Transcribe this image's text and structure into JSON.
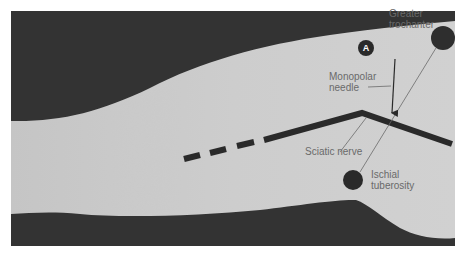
{
  "figure": {
    "colors": {
      "background_dark": "#2e2e2e",
      "skin": "#cfcfcf",
      "line": "#2a2a2a",
      "label_text": "#6a6a6a",
      "page": "#ffffff"
    },
    "markers": {
      "a": {
        "label": "A"
      },
      "greater_trochanter": {
        "label": ""
      },
      "ischial_tuberosity": {
        "label": ""
      }
    },
    "labels": {
      "greater_trochanter": [
        "Greater",
        "trochanter"
      ],
      "monopolar_needle": [
        "Monopolar",
        "needle"
      ],
      "sciatic_nerve": "Sciatic nerve",
      "ischial_tuberosity": [
        "Ischial",
        "tuberosity"
      ]
    }
  }
}
